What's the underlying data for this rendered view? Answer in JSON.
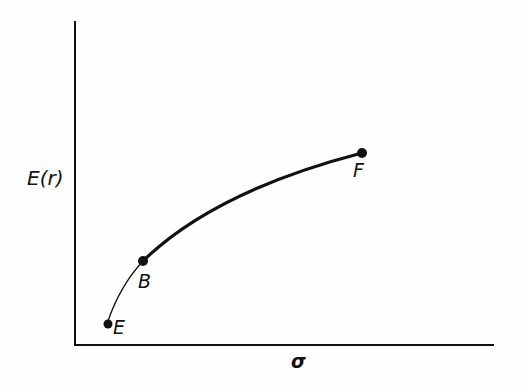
{
  "diagram": {
    "type": "efficient-frontier",
    "y_axis_label": "E(r)",
    "x_axis_label": "σ",
    "colors": {
      "ink": "#111111",
      "background": "#fefefe"
    },
    "points": [
      {
        "id": "E",
        "label": "E",
        "x": 108,
        "y": 324
      },
      {
        "id": "B",
        "label": "B",
        "x": 143,
        "y": 261
      },
      {
        "id": "F",
        "label": "F",
        "x": 362,
        "y": 153
      }
    ],
    "curves": [
      {
        "from": "E",
        "to": "B",
        "style": "thin"
      },
      {
        "from": "B",
        "to": "F",
        "style": "thick"
      }
    ]
  }
}
